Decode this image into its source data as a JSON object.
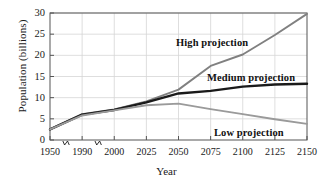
{
  "chart_data": {
    "type": "line",
    "title": "",
    "xlabel": "Year",
    "ylabel": "Population (billions)",
    "ylim": [
      0,
      30
    ],
    "yticks": [
      0,
      5,
      10,
      15,
      20,
      25,
      30
    ],
    "ytick_labels": [
      "0",
      "5",
      "10",
      "15",
      "20",
      "25",
      "30"
    ],
    "xticks": [
      1950,
      1990,
      2000,
      2025,
      2050,
      2075,
      2100,
      2125,
      2150
    ],
    "xtick_labels": [
      "1950",
      "1990",
      "2000",
      "2025",
      "2050",
      "2075",
      "2100",
      "2125",
      "2150"
    ],
    "axis_breaks": [
      {
        "between": [
          1950,
          1990
        ],
        "symbol": "zigzag"
      },
      {
        "between": [
          1990,
          2000
        ],
        "symbol": "zigzag"
      }
    ],
    "grid": true,
    "legend_position": "inline-annotations",
    "series": [
      {
        "name": "High projection",
        "color": "#808080",
        "label_text": "High projection",
        "x": [
          1950,
          1990,
          2000,
          2025,
          2050,
          2075,
          2100,
          2125,
          2150
        ],
        "values": [
          2.5,
          6.1,
          7.2,
          9.1,
          11.9,
          17.5,
          20.2,
          24.8,
          29.8
        ]
      },
      {
        "name": "Medium projection",
        "color": "#1a1a1a",
        "label_text": "Medium projection",
        "x": [
          1950,
          1990,
          2000,
          2025,
          2050,
          2075,
          2100,
          2125,
          2150
        ],
        "values": [
          2.5,
          6.0,
          7.1,
          8.9,
          11.0,
          11.6,
          12.6,
          13.1,
          13.3
        ]
      },
      {
        "name": "Low projection",
        "color": "#9a9a9a",
        "label_text": "Low projection",
        "x": [
          1950,
          1990,
          2000,
          2025,
          2050,
          2075,
          2100,
          2125,
          2150
        ],
        "values": [
          2.5,
          5.8,
          7.0,
          8.2,
          8.6,
          7.3,
          6.1,
          4.9,
          3.8
        ]
      }
    ],
    "annotations": [
      {
        "text": "High projection",
        "x_px": 176,
        "y_px": 37,
        "bold": true
      },
      {
        "text": "Medium projection",
        "x_px": 207,
        "y_px": 72,
        "bold": true
      },
      {
        "text": "Low projection",
        "x_px": 214,
        "y_px": 127,
        "bold": true
      }
    ],
    "colors": {
      "high": "#808080",
      "medium": "#1a1a1a",
      "low": "#9a9a9a",
      "grid": "#d6d6d6",
      "frame": "#555555",
      "text": "#1a1a1a",
      "background": "#ffffff"
    }
  },
  "axes": {
    "x_label": "Year",
    "y_label": "Population (billions)"
  }
}
